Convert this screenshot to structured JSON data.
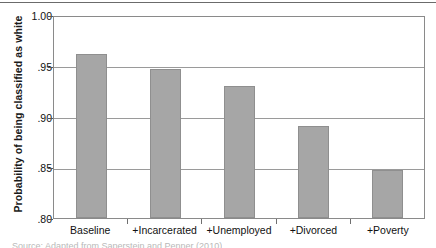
{
  "chart_data": {
    "type": "bar",
    "title": "",
    "xlabel": "",
    "ylabel": "Probability of being classified as white",
    "categories": [
      "Baseline",
      "+Incarcerated",
      "+Unemployed",
      "+Divorced",
      "+Poverty"
    ],
    "values": [
      0.962,
      0.947,
      0.93,
      0.891,
      0.847
    ],
    "ylim": [
      0.8,
      1.0
    ],
    "yticks": [
      "1.00",
      ".95",
      ".90",
      ".85",
      ".80"
    ],
    "ytick_values": [
      1.0,
      0.95,
      0.9,
      0.85,
      0.8
    ],
    "grid": true,
    "legend": false,
    "bar_color": "#a6a6a6",
    "bar_border_color": "#8f8f8f",
    "axis_color": "#8a8a8a",
    "gridline_color": "#9a9a9a"
  },
  "caption": {
    "source_note": "Source: Adapted from Saperstein and Penner (2010)"
  }
}
